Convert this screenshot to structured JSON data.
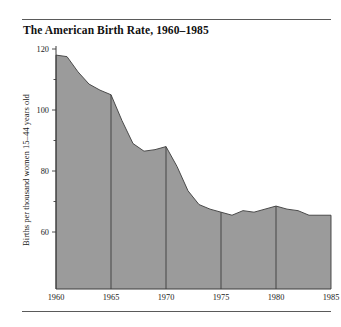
{
  "figure": {
    "title": "The American Birth Rate, 1960–1985",
    "has_top_rule": true,
    "has_bottom_rule": true,
    "background_color": "#ffffff"
  },
  "chart_data": {
    "type": "area",
    "title": "The American Birth Rate, 1960–1985",
    "xlabel": "",
    "ylabel": "Births per thousand women 15–44 years old",
    "xlim": [
      1960,
      1985
    ],
    "ylim": [
      52,
      124
    ],
    "grid": "vertical-only",
    "legend": "none",
    "fill_color": "#9b9b9b",
    "line_color": "#4a4a4a",
    "gridline_color": "#3d3d3d",
    "x_ticks": [
      1960,
      1965,
      1970,
      1975,
      1980,
      1985
    ],
    "x_tick_labels": [
      "1960",
      "1965",
      "1970",
      "1975",
      "1980",
      "1985"
    ],
    "y_ticks_major": [
      60,
      80,
      100,
      120
    ],
    "y_tick_labels": [
      "60",
      "80",
      "100",
      "120"
    ],
    "y_ticks_minor": [
      70,
      90,
      110
    ],
    "x": [
      1960,
      1961,
      1962,
      1963,
      1964,
      1965,
      1966,
      1967,
      1968,
      1969,
      1970,
      1971,
      1972,
      1973,
      1974,
      1975,
      1976,
      1977,
      1978,
      1979,
      1980,
      1981,
      1982,
      1983,
      1984,
      1985
    ],
    "values": [
      118.0,
      117.5,
      112.5,
      108.5,
      106.5,
      105.0,
      96.5,
      89.0,
      86.5,
      87.0,
      88.0,
      81.5,
      73.5,
      69.0,
      67.5,
      66.5,
      65.5,
      67.0,
      66.5,
      67.5,
      68.5,
      67.5,
      67.0,
      65.5,
      65.5,
      65.5
    ],
    "series_name": "Births per thousand women 15–44 years old"
  },
  "y_axis": {
    "label": "Births per thousand women 15–44 years old"
  }
}
